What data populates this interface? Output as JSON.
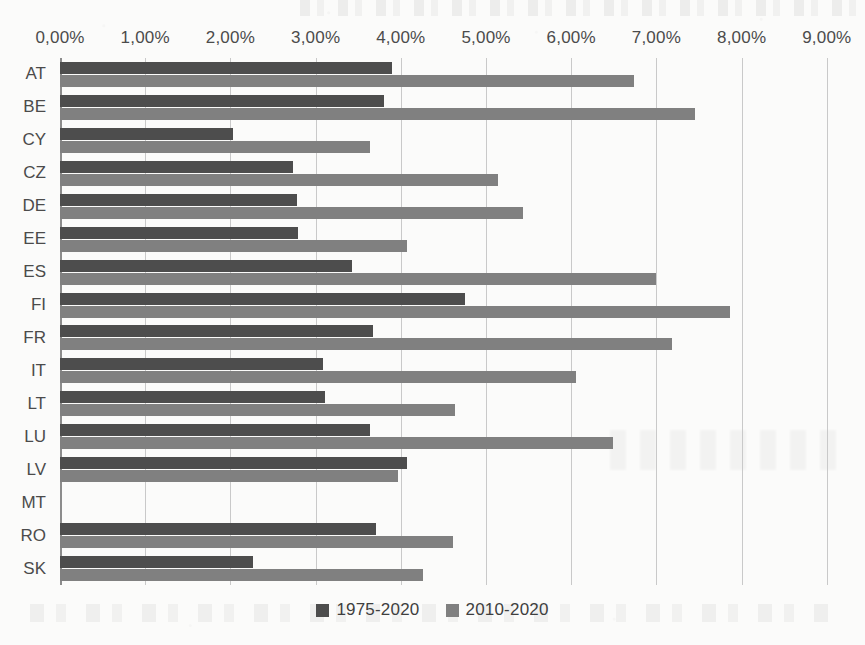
{
  "chart_data": {
    "type": "bar",
    "orientation": "horizontal",
    "title": "",
    "xlabel": "",
    "ylabel": "",
    "xlim": [
      0,
      9
    ],
    "xticks": [
      "0,00%",
      "1,00%",
      "2,00%",
      "3,00%",
      "4,00%",
      "5,00%",
      "6,00%",
      "7,00%",
      "8,00%",
      "9,00%"
    ],
    "xtick_values": [
      0,
      1,
      2,
      3,
      4,
      5,
      6,
      7,
      8,
      9
    ],
    "grid": true,
    "legend_position": "bottom",
    "categories": [
      "AT",
      "BE",
      "CY",
      "CZ",
      "DE",
      "EE",
      "ES",
      "FI",
      "FR",
      "IT",
      "LT",
      "LU",
      "LV",
      "MT",
      "RO",
      "SK"
    ],
    "series": [
      {
        "name": "1975-2020",
        "color": "#4d4d4d",
        "values": [
          3.9,
          3.8,
          2.03,
          2.73,
          2.78,
          2.79,
          3.43,
          4.75,
          3.67,
          3.09,
          3.11,
          3.64,
          4.07,
          0.0,
          3.71,
          2.27
        ]
      },
      {
        "name": "2010-2020",
        "color": "#808080",
        "values": [
          6.74,
          7.45,
          3.64,
          5.14,
          5.44,
          4.07,
          7.0,
          7.86,
          7.18,
          6.06,
          4.64,
          6.49,
          3.97,
          0.0,
          4.61,
          4.26
        ]
      }
    ]
  },
  "legend": {
    "items": [
      {
        "label": "1975-2020",
        "color": "#4d4d4d"
      },
      {
        "label": "2010-2020",
        "color": "#808080"
      }
    ]
  }
}
